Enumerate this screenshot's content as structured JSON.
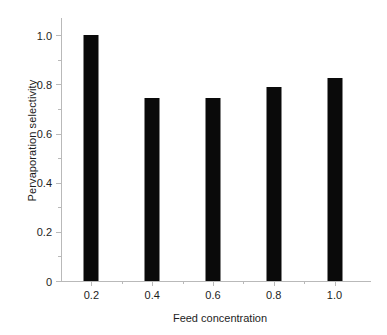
{
  "chart_data": {
    "type": "bar",
    "title": "",
    "subtitle": "",
    "xlabel": "Feed concentration",
    "ylabel": "Pervaporation selectivity",
    "categories": [
      "0.2",
      "0.4",
      "0.6",
      "0.8",
      "1.0"
    ],
    "values": [
      1.0,
      0.745,
      0.745,
      0.79,
      0.825
    ],
    "series": [
      {
        "name": "Pervaporation selectivity",
        "values": [
          1.0,
          0.745,
          0.745,
          0.79,
          0.825
        ],
        "color": "#0a0a0a"
      }
    ],
    "ylim": [
      0,
      1.07
    ],
    "xlim": [
      0.1,
      1.12
    ],
    "ytick_labels": [
      "0",
      "0.2",
      "0.4",
      "0.6",
      "0.8",
      "1.0"
    ],
    "ytick_values": [
      0,
      0.2,
      0.4,
      0.6,
      0.8,
      1.0
    ],
    "yminor_tick_values": [
      0.1,
      0.3,
      0.5,
      0.7,
      0.9
    ],
    "xtick_labels": [
      "0.2",
      "0.4",
      "0.6",
      "0.8",
      "1.0"
    ],
    "xtick_values": [
      0.2,
      0.4,
      0.6,
      0.8,
      1.0
    ],
    "xminor_tick_values": [
      0.3,
      0.5,
      0.7,
      0.9
    ],
    "grid": false,
    "legend": false,
    "legend_position": "none",
    "bar_color": "#0a0a0a",
    "axis_color": "#b9b9b9",
    "background_color": "#ffffff",
    "annotations": []
  }
}
